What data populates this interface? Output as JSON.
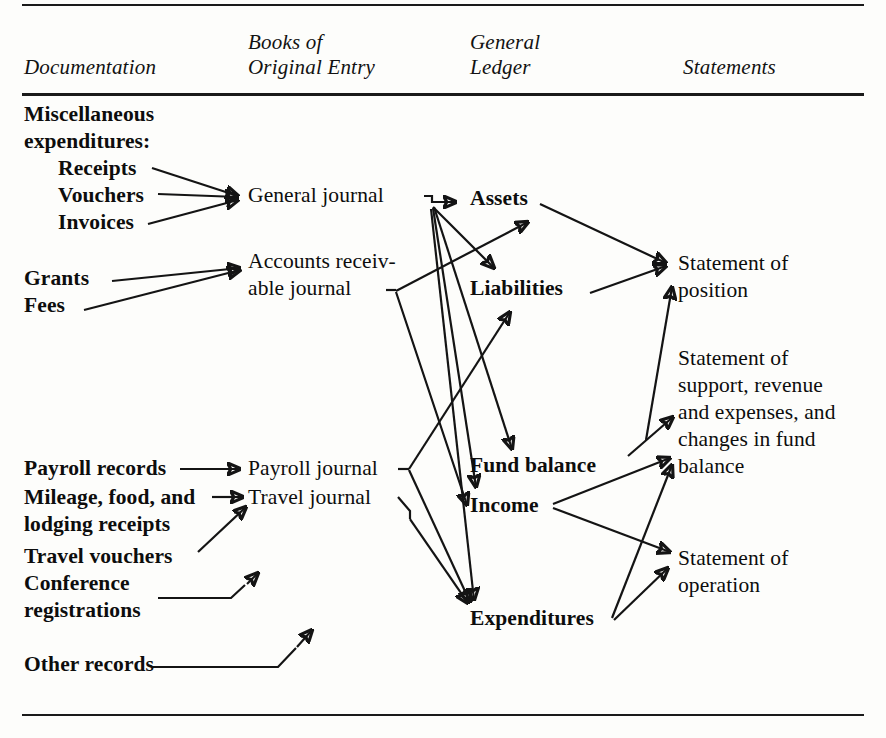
{
  "figure": {
    "type": "flow-diagram"
  },
  "headers": {
    "documentation": "Documentation",
    "books": "Books of\nOriginal Entry",
    "ledger": "General\nLedger",
    "statements": "Statements"
  },
  "documentation": {
    "miscellaneous": "Miscellaneous\nexpenditures:",
    "receipts": "Receipts",
    "vouchers": "Vouchers",
    "invoices": "Invoices",
    "grants": "Grants",
    "fees": "Fees",
    "payroll_records": "Payroll records",
    "mileage": "Mileage, food, and\nlodging receipts",
    "travel_vouchers": "Travel vouchers",
    "conference": "Conference\nregistrations",
    "other_records": "Other records"
  },
  "books": {
    "general_journal": "General journal",
    "ar_journal": "Accounts receiv-\nable journal",
    "payroll_journal": "Payroll journal",
    "travel_journal": "Travel journal"
  },
  "ledger": {
    "assets": "Assets",
    "liabilities": "Liabilities",
    "fund_balance": "Fund balance",
    "income": "Income",
    "expenditures": "Expenditures"
  },
  "statements": {
    "position": "Statement of\nposition",
    "support": "Statement of\nsupport, revenue\nand expenses, and\nchanges in fund\nbalance",
    "operation": "Statement of\noperation"
  },
  "colors": {
    "ink": "#141414",
    "paper": "#fdfdfb"
  },
  "flows": [
    {
      "from": "Receipts",
      "to": "General journal"
    },
    {
      "from": "Vouchers",
      "to": "General journal"
    },
    {
      "from": "Invoices",
      "to": "General journal"
    },
    {
      "from": "Grants",
      "to": "Accounts receivable journal"
    },
    {
      "from": "Fees",
      "to": "Accounts receivable journal"
    },
    {
      "from": "Payroll records",
      "to": "Payroll journal"
    },
    {
      "from": "Mileage, food, and lodging receipts",
      "to": "Travel journal"
    },
    {
      "from": "Travel vouchers",
      "to": "Travel journal"
    },
    {
      "from": "Conference registrations",
      "to": "Travel journal"
    },
    {
      "from": "Other records",
      "to": "Travel journal"
    },
    {
      "from": "General journal",
      "to": "Assets"
    },
    {
      "from": "General journal",
      "to": "Liabilities"
    },
    {
      "from": "General journal",
      "to": "Fund balance"
    },
    {
      "from": "General journal",
      "to": "Income"
    },
    {
      "from": "General journal",
      "to": "Expenditures"
    },
    {
      "from": "Accounts receivable journal",
      "to": "Assets"
    },
    {
      "from": "Accounts receivable journal",
      "to": "Income"
    },
    {
      "from": "Payroll journal",
      "to": "Liabilities"
    },
    {
      "from": "Payroll journal",
      "to": "Expenditures"
    },
    {
      "from": "Travel journal",
      "to": "Expenditures"
    },
    {
      "from": "Assets",
      "to": "Statement of position"
    },
    {
      "from": "Liabilities",
      "to": "Statement of position"
    },
    {
      "from": "Fund balance",
      "to": "Statement of position"
    },
    {
      "from": "Fund balance",
      "to": "Statement of support, revenue and expenses, and changes in fund balance"
    },
    {
      "from": "Income",
      "to": "Statement of support, revenue and expenses, and changes in fund balance"
    },
    {
      "from": "Income",
      "to": "Statement of operation"
    },
    {
      "from": "Expenditures",
      "to": "Statement of support, revenue and expenses, and changes in fund balance"
    },
    {
      "from": "Expenditures",
      "to": "Statement of operation"
    }
  ]
}
